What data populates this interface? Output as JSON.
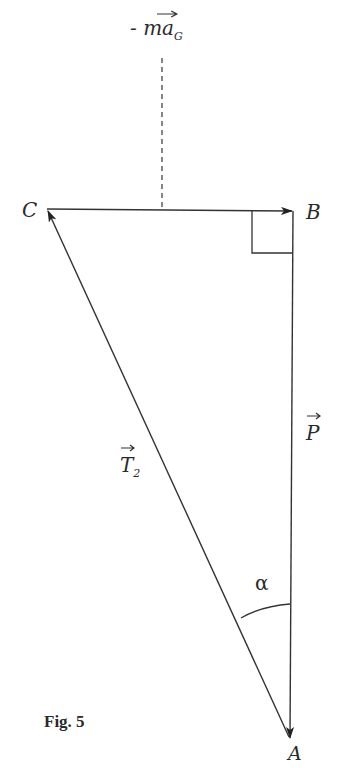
{
  "figure": {
    "caption": "Fig. 5",
    "points": {
      "A": {
        "label": "A",
        "x": 290,
        "y": 738
      },
      "B": {
        "label": "B",
        "x": 293,
        "y": 211
      },
      "C": {
        "label": "C",
        "x": 46,
        "y": 209
      }
    },
    "vectors": [
      {
        "name": "P",
        "label": "P",
        "from": "B",
        "to": "A"
      },
      {
        "name": "T2",
        "label": "T",
        "subscript": "2",
        "from": "A",
        "to": "C"
      },
      {
        "name": "ma_G",
        "label": "- ma",
        "subscript": "G",
        "from": "C",
        "to": "B",
        "note": "inertial force -m·a_G"
      }
    ],
    "angle": {
      "label": "α",
      "vertex": "A",
      "between": [
        "AB",
        "AC"
      ]
    },
    "right_angle_at": "B",
    "dashed_line_label": {
      "prefix": "- ",
      "main": "ma",
      "subscript": "G"
    },
    "colors": {
      "stroke": "#333333",
      "text": "#2a2a2a",
      "background": "#ffffff"
    }
  }
}
